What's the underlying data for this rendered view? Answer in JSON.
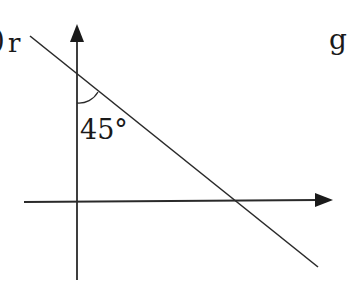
{
  "diagram": {
    "option_label": "r",
    "option_paren": ")",
    "next_option_label": "g",
    "angle_label": "45°",
    "angle_value": 45,
    "colors": {
      "stroke": "#2a2a2a",
      "background": "#ffffff"
    }
  }
}
